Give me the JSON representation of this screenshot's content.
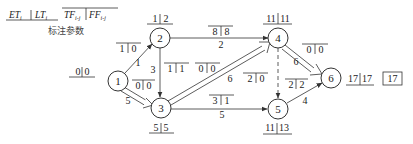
{
  "legend": {
    "et_label": "ET",
    "et_sub": "i",
    "lt_label": "LT",
    "lt_sub": "i",
    "tf_label": "TF",
    "tf_sub": "i-j",
    "ff_label": "FF",
    "ff_sub": "i-j",
    "caption": "标注参数"
  },
  "nodes": [
    {
      "id": "1",
      "label": "1",
      "et": "0",
      "lt": "0"
    },
    {
      "id": "2",
      "label": "2",
      "et": "1",
      "lt": "2"
    },
    {
      "id": "3",
      "label": "3",
      "et": "5",
      "lt": "5"
    },
    {
      "id": "4",
      "label": "4",
      "et": "11",
      "lt": "11"
    },
    {
      "id": "5",
      "label": "5",
      "et": "11",
      "lt": "13"
    },
    {
      "id": "6",
      "label": "6",
      "et": "17",
      "lt": "17"
    }
  ],
  "activities": [
    {
      "from": "1",
      "to": "2",
      "duration": "1",
      "tf": "1",
      "ff": "0",
      "critical": false
    },
    {
      "from": "1",
      "to": "3",
      "duration": "5",
      "tf": "0",
      "ff": "0",
      "critical": true
    },
    {
      "from": "2",
      "to": "3",
      "duration": "3",
      "tf": "1",
      "ff": "1",
      "critical": false
    },
    {
      "from": "2",
      "to": "4",
      "duration": "2",
      "tf": "8",
      "ff": "8",
      "critical": false
    },
    {
      "from": "3",
      "to": "4",
      "duration": "6",
      "tf": "0",
      "ff": "0",
      "critical": true
    },
    {
      "from": "3",
      "to": "5",
      "duration": "5",
      "tf": "3",
      "ff": "1",
      "critical": false
    },
    {
      "from": "4",
      "to": "5",
      "duration": "",
      "tf": "2",
      "ff": "0",
      "critical": false,
      "dummy": true
    },
    {
      "from": "4",
      "to": "6",
      "duration": "6",
      "tf": "0",
      "ff": "0",
      "critical": true
    },
    {
      "from": "5",
      "to": "6",
      "duration": "4",
      "tf": "2",
      "ff": "2",
      "critical": false
    }
  ],
  "project_duration": "17",
  "colors": {
    "line": "#333333",
    "background": "#ffffff"
  }
}
